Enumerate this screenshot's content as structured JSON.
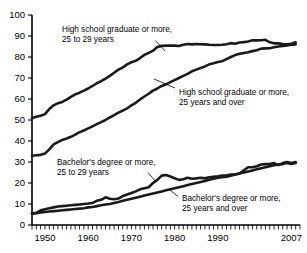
{
  "chart_data": {
    "type": "line",
    "title": "",
    "subtitle": "",
    "xlabel": "",
    "ylabel": "",
    "xlim": [
      1947,
      2009
    ],
    "ylim": [
      0,
      100
    ],
    "yticks": [
      0,
      10,
      20,
      30,
      40,
      50,
      60,
      70,
      80,
      90,
      100
    ],
    "xticks": [
      1950,
      1960,
      1970,
      1980,
      1990,
      2007
    ],
    "xtick_labels": [
      "1950",
      "1960",
      "1970",
      "1980",
      "1990",
      "2007"
    ],
    "ytick_labels": [
      "0",
      "10",
      "20",
      "30",
      "40",
      "50",
      "60",
      "70",
      "80",
      "90",
      "100"
    ],
    "grid": false,
    "legend_position": "inline-annotations",
    "minor_ticks": "annual",
    "x": [
      1947,
      1948,
      1949,
      1950,
      1951,
      1952,
      1953,
      1954,
      1955,
      1956,
      1957,
      1958,
      1959,
      1960,
      1961,
      1962,
      1963,
      1964,
      1965,
      1966,
      1967,
      1968,
      1969,
      1970,
      1971,
      1972,
      1973,
      1974,
      1975,
      1976,
      1977,
      1978,
      1979,
      1980,
      1981,
      1982,
      1983,
      1984,
      1985,
      1986,
      1987,
      1988,
      1989,
      1990,
      1991,
      1992,
      1993,
      1994,
      1995,
      1996,
      1997,
      1998,
      1999,
      2000,
      2001,
      2002,
      2003,
      2004,
      2005,
      2006,
      2007,
      2008
    ],
    "series": [
      {
        "name": "High school graduate or more, 25 to 29 years",
        "values": [
          51.0,
          51.5,
          52.0,
          52.8,
          55.2,
          57.0,
          58.0,
          58.6,
          59.7,
          61.0,
          62.2,
          63.0,
          64.0,
          65.0,
          66.2,
          67.5,
          68.5,
          69.7,
          71.0,
          72.5,
          74.0,
          75.0,
          76.5,
          77.5,
          78.2,
          79.5,
          81.0,
          82.0,
          83.0,
          84.8,
          85.3,
          85.4,
          85.5,
          85.4,
          85.2,
          85.8,
          86.2,
          86.0,
          86.2,
          86.1,
          86.0,
          85.8,
          85.7,
          85.7,
          85.8,
          86.1,
          86.6,
          86.3,
          86.9,
          87.1,
          87.4,
          88.0,
          87.9,
          88.0,
          88.2,
          87.0,
          86.5,
          86.5,
          86.2,
          86.0,
          86.3,
          87.0
        ]
      },
      {
        "name": "High school graduate or more, 25 years and over",
        "values": [
          33.0,
          33.2,
          33.4,
          34.0,
          36.0,
          38.4,
          39.5,
          40.5,
          41.2,
          42.0,
          43.0,
          44.2,
          45.0,
          46.0,
          47.0,
          48.0,
          49.0,
          50.0,
          51.2,
          52.3,
          53.5,
          54.5,
          55.5,
          57.0,
          58.2,
          59.8,
          61.2,
          62.5,
          64.0,
          65.0,
          66.2,
          67.0,
          68.0,
          69.0,
          70.0,
          71.0,
          72.0,
          73.2,
          74.0,
          74.8,
          75.5,
          76.5,
          77.0,
          77.6,
          78.0,
          79.0,
          80.0,
          80.9,
          81.5,
          81.9,
          82.3,
          82.8,
          83.2,
          84.0,
          84.1,
          84.2,
          84.6,
          85.0,
          85.2,
          85.5,
          85.8,
          86.0
        ]
      },
      {
        "name": "Bachelor's degree or more, 25 to 29 years",
        "values": [
          5.5,
          5.8,
          7.0,
          7.5,
          8.0,
          8.4,
          8.8,
          9.0,
          9.2,
          9.4,
          9.6,
          9.8,
          10.0,
          10.2,
          10.5,
          11.5,
          12.0,
          13.2,
          12.5,
          12.3,
          12.6,
          13.8,
          14.5,
          15.2,
          16.0,
          17.0,
          17.5,
          18.0,
          20.0,
          21.5,
          23.5,
          23.8,
          23.1,
          22.3,
          21.5,
          21.8,
          22.5,
          22.0,
          22.2,
          22.5,
          22.2,
          22.7,
          23.0,
          23.2,
          23.5,
          23.6,
          24.0,
          24.0,
          24.5,
          26.0,
          27.5,
          27.5,
          28.0,
          28.8,
          29.0,
          29.0,
          29.5,
          28.5,
          29.5,
          30.0,
          29.5,
          30.0
        ]
      },
      {
        "name": "Bachelor's degree or more, 25 years and over",
        "values": [
          5.4,
          5.6,
          6.0,
          6.2,
          6.4,
          6.6,
          6.8,
          7.0,
          7.2,
          7.4,
          7.6,
          7.8,
          8.0,
          8.4,
          8.6,
          9.0,
          9.4,
          9.8,
          10.0,
          10.5,
          11.0,
          11.5,
          12.0,
          12.5,
          13.0,
          13.5,
          14.0,
          14.5,
          15.0,
          15.5,
          16.0,
          16.5,
          17.0,
          17.5,
          18.0,
          18.5,
          19.0,
          19.5,
          20.0,
          20.5,
          21.0,
          21.5,
          22.0,
          22.5,
          22.8,
          23.0,
          23.5,
          24.0,
          24.5,
          25.0,
          25.5,
          26.0,
          26.5,
          27.0,
          27.5,
          28.0,
          28.5,
          28.8,
          29.0,
          29.5,
          29.0,
          29.5
        ]
      }
    ],
    "annotations": [
      {
        "id": "hs-25-29",
        "line1": "High school graduate or more,",
        "line2": "25 to 29 years"
      },
      {
        "id": "hs-25-over",
        "line1": "High school graduate or more,",
        "line2": "25 years and over"
      },
      {
        "id": "ba-25-29",
        "line1": "Bachelor's degree or more,",
        "line2": "25 to 29 years"
      },
      {
        "id": "ba-25-over",
        "line1": "Bachelor's degree or more,",
        "line2": "25 years and over"
      }
    ],
    "colors": {
      "line": "#1a1a1a",
      "axis": "#000000",
      "background": "#ffffff",
      "text": "#000000"
    }
  }
}
